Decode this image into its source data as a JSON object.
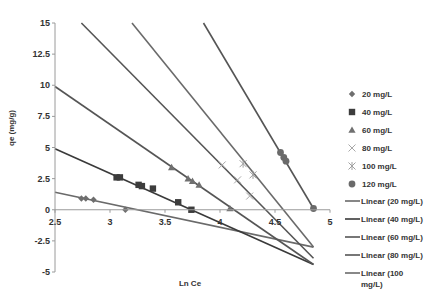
{
  "chart_data": {
    "type": "scatter",
    "title": "",
    "xlabel": "Ln Ce",
    "ylabel": "qe (mg/g)",
    "xlim": [
      2.5,
      5
    ],
    "ylim": [
      -5,
      15
    ],
    "xticks": [
      "2.5",
      "3",
      "3.5",
      "4",
      "4.5",
      "5"
    ],
    "yticks": [
      "15",
      "12.5",
      "10",
      "7.5",
      "5",
      "2.5",
      "0",
      "-2.5",
      "-5"
    ],
    "grid": false,
    "legend_position": "right",
    "series": [
      {
        "name": "20 mg/L",
        "marker": "diamond",
        "color": "#6e6e6e",
        "points": [
          [
            2.74,
            0.9
          ],
          [
            2.78,
            0.9
          ],
          [
            2.85,
            0.8
          ],
          [
            3.14,
            0.0
          ]
        ]
      },
      {
        "name": "40 mg/L",
        "marker": "square",
        "color": "#3c3c3c",
        "points": [
          [
            3.06,
            2.6
          ],
          [
            3.09,
            2.6
          ],
          [
            3.26,
            2.0
          ],
          [
            3.29,
            1.9
          ],
          [
            3.39,
            1.7
          ],
          [
            3.62,
            0.6
          ],
          [
            3.74,
            0.0
          ]
        ]
      },
      {
        "name": "60 mg/L",
        "marker": "triangle",
        "color": "#707070",
        "points": [
          [
            3.56,
            3.4
          ],
          [
            3.71,
            2.5
          ],
          [
            3.75,
            2.3
          ],
          [
            3.81,
            2.0
          ],
          [
            4.09,
            0.1
          ]
        ]
      },
      {
        "name": "80 mg/L",
        "marker": "x",
        "color": "#a8a8a8",
        "points": [
          [
            4.02,
            3.6
          ],
          [
            4.16,
            2.4
          ],
          [
            4.27,
            1.1
          ]
        ]
      },
      {
        "name": "100 mg/L",
        "marker": "asterisk",
        "color": "#a0a0a0",
        "points": [
          [
            4.21,
            3.7
          ],
          [
            4.3,
            2.8
          ]
        ]
      },
      {
        "name": "120 mg/L",
        "marker": "circle",
        "color": "#6a6a6a",
        "points": [
          [
            4.55,
            4.6
          ],
          [
            4.58,
            4.2
          ],
          [
            4.6,
            3.9
          ],
          [
            4.85,
            0.1
          ]
        ]
      }
    ],
    "trendlines": [
      {
        "name": "Linear (20 mg/L)",
        "color": "#6a6a6a",
        "from": [
          2.5,
          1.4
        ],
        "to": [
          4.85,
          -3.0
        ]
      },
      {
        "name": "Linear (40 mg/L)",
        "color": "#3a3a3a",
        "from": [
          2.5,
          4.9
        ],
        "to": [
          4.85,
          -4.4
        ]
      },
      {
        "name": "Linear (60 mg/L)",
        "color": "#555555",
        "from": [
          2.5,
          9.9
        ],
        "to": [
          4.85,
          -4.4
        ]
      },
      {
        "name": "Linear (80 mg/L)",
        "color": "#555555",
        "from": [
          2.74,
          15
        ],
        "to": [
          4.85,
          -3.9
        ]
      },
      {
        "name": "Linear (100 mg/L)",
        "color": "#6a6a6a",
        "from": [
          3.2,
          15
        ],
        "to": [
          4.85,
          -3.0
        ]
      },
      {
        "name": "Linear (120 mg/L)",
        "color": "#555555",
        "from": [
          3.85,
          15
        ],
        "to": [
          4.85,
          0.1
        ]
      }
    ],
    "legend_entries": [
      "20 mg/L",
      "40 mg/L",
      "60 mg/L",
      "80 mg/L",
      "100 mg/L",
      "120 mg/L",
      "Linear (20 mg/L)",
      "Linear (40 mg/L)",
      "Linear (60 mg/L)",
      "Linear (80 mg/L)",
      "Linear (100 mg/L)"
    ]
  },
  "axis": {
    "xlabel": "Ln Ce",
    "ylabel": "qe (mg/g)"
  }
}
